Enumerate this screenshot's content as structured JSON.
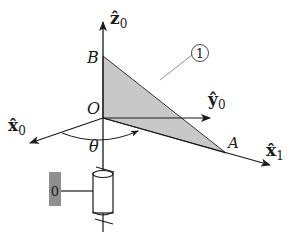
{
  "diagram": {
    "type": "robot-joint-kinematics",
    "labels": {
      "z0": "ẑ",
      "z0_sub": "0",
      "y0": "ŷ",
      "y0_sub": "0",
      "x0": "x̂",
      "x0_sub": "0",
      "x1": "x̂",
      "x1_sub": "1",
      "origin": "O",
      "point_a": "A",
      "point_b": "B",
      "angle": "θ",
      "link_callout": "1",
      "base_link": "0"
    },
    "colors": {
      "line": "#1a1a1a",
      "triangle_fill": "#c8c8c8",
      "base_fill": "#8f8f8f",
      "leader_line": "#777777"
    }
  }
}
